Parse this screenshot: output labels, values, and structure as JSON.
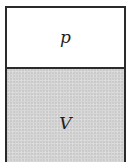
{
  "diagram": {
    "type": "container-with-two-regions",
    "top_region": {
      "label": "p",
      "fill": "#ffffff"
    },
    "bottom_region": {
      "label": "V",
      "fill": "#d6d6d6"
    },
    "border_color": "#2b2b2b"
  }
}
